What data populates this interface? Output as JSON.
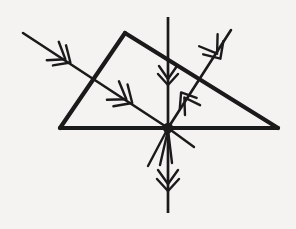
{
  "figure": {
    "type": "optics-ray-diagram",
    "background_color": "#f4f3f1",
    "ink_color": "#1a1a1a",
    "canvas": {
      "width": 296,
      "height": 229
    }
  },
  "prism": {
    "name": "triangular-prism",
    "stroke_width": 4.2,
    "vertices": [
      {
        "label": "apex",
        "x": 125,
        "y": 33
      },
      {
        "label": "bottom-left",
        "x": 60,
        "y": 128
      },
      {
        "label": "bottom-right",
        "x": 278,
        "y": 128
      }
    ],
    "path": "M 125 33 L 60 128 L 278 128 L 125 33 Z"
  },
  "normal": {
    "name": "normal-line",
    "description": "vertical normal through the incidence point",
    "x": 168,
    "y_top": 17,
    "y_bottom": 213,
    "stroke_width": 2.7
  },
  "incidence_point": {
    "x": 168,
    "y": 128,
    "dot_radius": 5.2
  },
  "rays": [
    {
      "name": "incident-ray",
      "from": {
        "x": 23,
        "y": 33
      },
      "to": {
        "x": 168,
        "y": 128
      },
      "direction": "down-right",
      "marker_count": 2
    },
    {
      "name": "reflected-ray",
      "from": {
        "x": 168,
        "y": 128
      },
      "to": {
        "x": 231,
        "y": 30
      },
      "direction": "up-right",
      "marker_count": 2
    }
  ],
  "stubs": [
    {
      "name": "ray-stub-lower-left",
      "from": {
        "x": 168,
        "y": 128
      },
      "to": {
        "x": 148,
        "y": 166
      }
    },
    {
      "name": "ray-stub-lower-right",
      "from": {
        "x": 168,
        "y": 128
      },
      "to": {
        "x": 194,
        "y": 147
      }
    },
    {
      "name": "ray-stub-lower-inner-left",
      "from": {
        "x": 168,
        "y": 130
      },
      "to": {
        "x": 160,
        "y": 165
      }
    },
    {
      "name": "ray-stub-lower-inner-right",
      "from": {
        "x": 168,
        "y": 130
      },
      "to": {
        "x": 172,
        "y": 163
      }
    }
  ],
  "arrow_markers": [
    {
      "name": "arrow-marker-incident-outer",
      "x": 62,
      "y": 57,
      "angle_deg": 33,
      "kind": "double-chevron",
      "points": "down-right"
    },
    {
      "name": "arrow-marker-incident-inner",
      "x": 123,
      "y": 97,
      "angle_deg": 33,
      "kind": "double-chevron",
      "points": "down-right"
    },
    {
      "name": "arrow-marker-normal-upper",
      "x": 168,
      "y": 76,
      "angle_deg": 90,
      "kind": "double-chevron",
      "points": "down"
    },
    {
      "name": "arrow-marker-normal-lower",
      "x": 168,
      "y": 181,
      "angle_deg": 90,
      "kind": "double-chevron",
      "points": "down"
    },
    {
      "name": "arrow-marker-reflected-lower",
      "x": 186,
      "y": 100,
      "angle_deg": 237,
      "kind": "double-chevron",
      "points": "down-left"
    },
    {
      "name": "arrow-marker-reflected-upper",
      "x": 216,
      "y": 52,
      "angle_deg": 57,
      "kind": "double-chevron",
      "points": "up-right"
    }
  ]
}
